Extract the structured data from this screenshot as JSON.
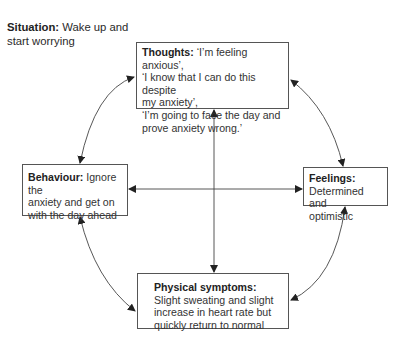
{
  "situation": {
    "label": "Situation:",
    "text": " Wake up and start worrying"
  },
  "thoughts": {
    "label": "Thoughts:",
    "lines": [
      " ‘I’m feeling anxious’,",
      "‘I know that I can do this despite",
      "my anxiety’,",
      "‘I’m going to face the day and",
      "prove anxiety wrong.’"
    ]
  },
  "behaviour": {
    "label": "Behaviour:",
    "lines": [
      " Ignore the",
      "anxiety and get on",
      "with the day ahead"
    ]
  },
  "feelings": {
    "label": "Feelings:",
    "lines": [
      "Determined and",
      "optimistic"
    ]
  },
  "physical": {
    "label": "Physical symptoms:",
    "lines": [
      "Slight sweating and slight",
      "increase in heart rate but",
      "quickly return to normal"
    ]
  },
  "colors": {
    "line": "#444444",
    "border": "#555555",
    "text": "#2a2a2a"
  }
}
